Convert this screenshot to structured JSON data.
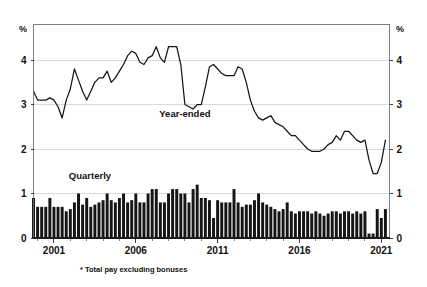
{
  "chart_data": {
    "type": "bar",
    "title": "",
    "subtitle": "",
    "xlabel": "",
    "ylabel": "",
    "unit_label_left": "%",
    "unit_label_right": "%",
    "ylim": [
      0,
      4.8
    ],
    "yticks": [
      0,
      1,
      2,
      3,
      4
    ],
    "ytick_labels": [
      "0",
      "1",
      "2",
      "3",
      "4"
    ],
    "xticks": [
      2001,
      2006,
      2011,
      2016,
      2021
    ],
    "xtick_labels": [
      "2001",
      "2006",
      "2011",
      "2016",
      "2021"
    ],
    "xlim": [
      1999.75,
      2021.5
    ],
    "grid": true,
    "grid_axis": "y",
    "legend_position": "inline-annotations",
    "footnote": "* Total pay excluding bonuses",
    "annotations": [
      {
        "text": "Year-ended",
        "x": 2009.0,
        "y": 2.72
      },
      {
        "text": "Quarterly",
        "x": 2003.2,
        "y": 1.32
      }
    ],
    "series": [
      {
        "name": "Year-ended",
        "type": "line",
        "color": "#151515",
        "x": [
          1999.75,
          2000.0,
          2000.25,
          2000.5,
          2000.75,
          2001.0,
          2001.25,
          2001.5,
          2001.75,
          2002.0,
          2002.25,
          2002.5,
          2002.75,
          2003.0,
          2003.25,
          2003.5,
          2003.75,
          2004.0,
          2004.25,
          2004.5,
          2004.75,
          2005.0,
          2005.25,
          2005.5,
          2005.75,
          2006.0,
          2006.25,
          2006.5,
          2006.75,
          2007.0,
          2007.25,
          2007.5,
          2007.75,
          2008.0,
          2008.25,
          2008.5,
          2008.75,
          2009.0,
          2009.25,
          2009.5,
          2009.75,
          2010.0,
          2010.25,
          2010.5,
          2010.75,
          2011.0,
          2011.25,
          2011.5,
          2011.75,
          2012.0,
          2012.25,
          2012.5,
          2012.75,
          2013.0,
          2013.25,
          2013.5,
          2013.75,
          2014.0,
          2014.25,
          2014.5,
          2014.75,
          2015.0,
          2015.25,
          2015.5,
          2015.75,
          2016.0,
          2016.25,
          2016.5,
          2016.75,
          2017.0,
          2017.25,
          2017.5,
          2017.75,
          2018.0,
          2018.25,
          2018.5,
          2018.75,
          2019.0,
          2019.25,
          2019.5,
          2019.75,
          2020.0,
          2020.25,
          2020.5,
          2020.75,
          2021.0,
          2021.25
        ],
        "values": [
          3.3,
          3.1,
          3.1,
          3.1,
          3.15,
          3.1,
          2.95,
          2.7,
          3.1,
          3.35,
          3.8,
          3.55,
          3.3,
          3.1,
          3.3,
          3.5,
          3.6,
          3.6,
          3.75,
          3.5,
          3.6,
          3.75,
          3.9,
          4.1,
          4.2,
          4.15,
          3.95,
          3.9,
          4.05,
          4.1,
          4.3,
          4.05,
          3.95,
          4.3,
          4.3,
          4.3,
          3.9,
          3.0,
          2.95,
          2.9,
          3.0,
          3.0,
          3.4,
          3.85,
          3.9,
          3.8,
          3.7,
          3.65,
          3.65,
          3.65,
          3.85,
          3.8,
          3.5,
          3.1,
          2.85,
          2.7,
          2.65,
          2.7,
          2.75,
          2.6,
          2.55,
          2.5,
          2.4,
          2.3,
          2.3,
          2.2,
          2.1,
          2.0,
          1.95,
          1.95,
          1.95,
          2.0,
          2.1,
          2.15,
          2.3,
          2.2,
          2.4,
          2.4,
          2.3,
          2.2,
          2.15,
          2.2,
          1.75,
          1.45,
          1.45,
          1.7,
          2.2
        ]
      },
      {
        "name": "Quarterly",
        "type": "bar",
        "color": "#151515",
        "x": [
          1999.75,
          2000.0,
          2000.25,
          2000.5,
          2000.75,
          2001.0,
          2001.25,
          2001.5,
          2001.75,
          2002.0,
          2002.25,
          2002.5,
          2002.75,
          2003.0,
          2003.25,
          2003.5,
          2003.75,
          2004.0,
          2004.25,
          2004.5,
          2004.75,
          2005.0,
          2005.25,
          2005.5,
          2005.75,
          2006.0,
          2006.25,
          2006.5,
          2006.75,
          2007.0,
          2007.25,
          2007.5,
          2007.75,
          2008.0,
          2008.25,
          2008.5,
          2008.75,
          2009.0,
          2009.25,
          2009.5,
          2009.75,
          2010.0,
          2010.25,
          2010.5,
          2010.75,
          2011.0,
          2011.25,
          2011.5,
          2011.75,
          2012.0,
          2012.25,
          2012.5,
          2012.75,
          2013.0,
          2013.25,
          2013.5,
          2013.75,
          2014.0,
          2014.25,
          2014.5,
          2014.75,
          2015.0,
          2015.25,
          2015.5,
          2015.75,
          2016.0,
          2016.25,
          2016.5,
          2016.75,
          2017.0,
          2017.25,
          2017.5,
          2017.75,
          2018.0,
          2018.25,
          2018.5,
          2018.75,
          2019.0,
          2019.25,
          2019.5,
          2019.75,
          2020.0,
          2020.25,
          2020.5,
          2020.75,
          2021.0,
          2021.25
        ],
        "values": [
          0.9,
          0.7,
          0.7,
          0.7,
          0.9,
          0.7,
          0.7,
          0.7,
          0.6,
          0.65,
          0.8,
          1.0,
          0.75,
          0.9,
          0.7,
          0.75,
          0.8,
          0.85,
          1.0,
          0.85,
          0.8,
          0.9,
          1.0,
          0.8,
          0.85,
          1.0,
          0.8,
          0.8,
          1.0,
          1.1,
          1.1,
          0.8,
          0.8,
          1.0,
          1.1,
          1.1,
          1.0,
          1.0,
          0.8,
          1.1,
          1.2,
          0.9,
          0.9,
          0.85,
          0.45,
          0.85,
          0.8,
          0.8,
          0.8,
          1.1,
          0.8,
          0.7,
          0.75,
          0.75,
          0.85,
          1.0,
          0.8,
          0.75,
          0.7,
          0.65,
          0.6,
          0.65,
          0.8,
          0.6,
          0.55,
          0.6,
          0.6,
          0.6,
          0.55,
          0.6,
          0.55,
          0.5,
          0.55,
          0.6,
          0.6,
          0.55,
          0.6,
          0.6,
          0.55,
          0.6,
          0.55,
          0.6,
          0.1,
          0.1,
          0.65,
          0.45,
          0.65
        ]
      }
    ]
  },
  "figure": {
    "background_color": "#ffffff",
    "ink_color": "#151515",
    "grid_color": "#c9c9c9",
    "frame_color": "#6f6f6f"
  }
}
